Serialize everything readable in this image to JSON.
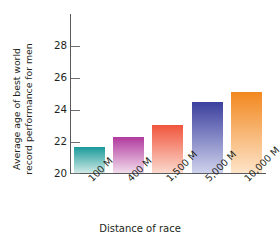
{
  "chart_data": {
    "type": "bar",
    "title": "",
    "categories": [
      "100 M",
      "400 M",
      "1,500 M",
      "5,000 M",
      "10,000 M"
    ],
    "values": [
      21.5,
      22.1,
      22.8,
      24.1,
      24.7
    ],
    "xlabel": "Distance of race",
    "ylabel_line1": "Average age of best world",
    "ylabel_line2": "record performance for men",
    "ylabel": "Average age of best world record performance for men",
    "ylim": [
      20,
      29.2
    ],
    "yticks": [
      28,
      26,
      24,
      22,
      20
    ],
    "ytick_labels": [
      "28",
      "26",
      "24",
      "22",
      "20"
    ],
    "grid": false,
    "legend": "none",
    "bar_colors_top": [
      "#1a9a9b",
      "#b13a9e",
      "#f0553d",
      "#3b3f9e",
      "#f2881f"
    ],
    "bar_colors_bottom": [
      "#cfeae6",
      "#f2dcec",
      "#fbd9cd",
      "#cfd2ec",
      "#fde4c9"
    ]
  }
}
